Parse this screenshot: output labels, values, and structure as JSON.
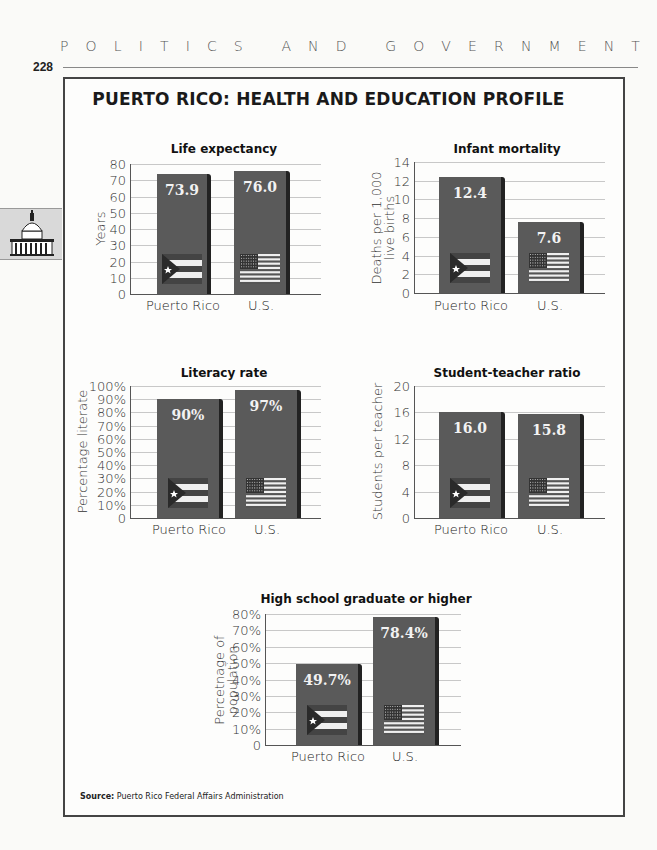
{
  "page": {
    "running_head": [
      "P",
      "O",
      "L",
      "I",
      "T",
      "I",
      "C",
      "S",
      "",
      "A",
      "N",
      "D",
      "",
      "G",
      "O",
      "V",
      "E",
      "R",
      "N",
      "M",
      "E",
      "N",
      "T"
    ],
    "page_number": "228",
    "side_tab_icon": "capitol-building-icon"
  },
  "figure": {
    "title": "PUERTO RICO: HEALTH AND EDUCATION PROFILE",
    "source_label": "Source:",
    "source_text": "Puerto Rico Federal Affairs Administration"
  },
  "colors": {
    "bar": "#5a5a5a",
    "bar_shadow": "#222222",
    "gridline": "#c8c8c8",
    "frame": "#444444"
  },
  "chart_data": [
    {
      "type": "bar",
      "title": "Life expectancy",
      "categories": [
        "Puerto Rico",
        "U.S."
      ],
      "values": [
        73.9,
        76.0
      ],
      "value_labels": [
        "73.9",
        "76.0"
      ],
      "xlabel": "",
      "ylabel": "Years",
      "ylim": [
        0,
        80
      ],
      "yticks": [
        "0",
        "10",
        "20",
        "30",
        "40",
        "50",
        "60",
        "70",
        "80"
      ],
      "grid": true,
      "flags": [
        "puerto-rico-flag-icon",
        "us-flag-icon"
      ]
    },
    {
      "type": "bar",
      "title": "Infant mortality",
      "categories": [
        "Puerto Rico",
        "U.S."
      ],
      "values": [
        12.4,
        7.6
      ],
      "value_labels": [
        "12.4",
        "7.6"
      ],
      "xlabel": "",
      "ylabel": "Deaths per 1,000 live births",
      "ylabel_lines": [
        "Deaths per 1,000",
        "live births"
      ],
      "ylim": [
        0,
        14
      ],
      "yticks": [
        "0",
        "2",
        "4",
        "6",
        "8",
        "10",
        "12",
        "14"
      ],
      "grid": true,
      "flags": [
        "puerto-rico-flag-icon",
        "us-flag-icon"
      ]
    },
    {
      "type": "bar",
      "title": "Literacy rate",
      "categories": [
        "Puerto Rico",
        "U.S."
      ],
      "values": [
        90,
        97
      ],
      "value_labels": [
        "90%",
        "97%"
      ],
      "xlabel": "",
      "ylabel": "Percentage literate",
      "ylim": [
        0,
        100
      ],
      "yticks": [
        "0",
        "10%",
        "20%",
        "30%",
        "40%",
        "50%",
        "60%",
        "70%",
        "80%",
        "90%",
        "100%"
      ],
      "grid": true,
      "flags": [
        "puerto-rico-flag-icon",
        "us-flag-icon"
      ]
    },
    {
      "type": "bar",
      "title": "Student-teacher ratio",
      "categories": [
        "Puerto Rico",
        "U.S."
      ],
      "values": [
        16.0,
        15.8
      ],
      "value_labels": [
        "16.0",
        "15.8"
      ],
      "xlabel": "",
      "ylabel": "Students per teacher",
      "ylim": [
        0,
        20
      ],
      "yticks": [
        "0",
        "4",
        "8",
        "12",
        "16",
        "20"
      ],
      "grid": true,
      "flags": [
        "puerto-rico-flag-icon",
        "us-flag-icon"
      ]
    },
    {
      "type": "bar",
      "title": "High school graduate or higher",
      "categories": [
        "Puerto Rico",
        "U.S."
      ],
      "values": [
        49.7,
        78.4
      ],
      "value_labels": [
        "49.7%",
        "78.4%"
      ],
      "xlabel": "",
      "ylabel": "Percetnage of population",
      "ylabel_lines": [
        "Percetnage of",
        "population"
      ],
      "ylim": [
        0,
        80
      ],
      "yticks": [
        "0",
        "10%",
        "20%",
        "30%",
        "40%",
        "50%",
        "60%",
        "70%",
        "80%"
      ],
      "grid": true,
      "flags": [
        "puerto-rico-flag-icon",
        "us-flag-icon"
      ]
    }
  ]
}
